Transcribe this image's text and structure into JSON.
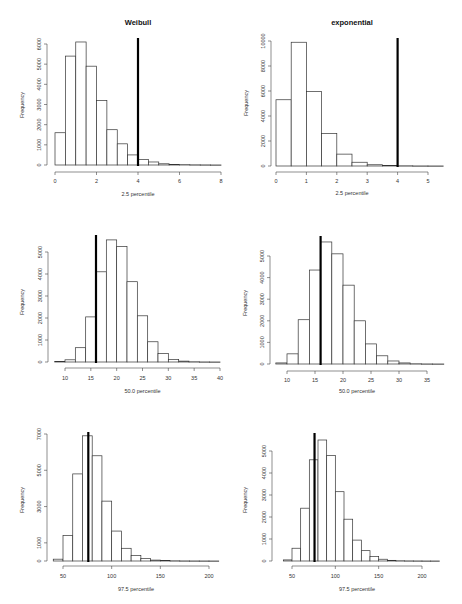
{
  "page": {
    "column_titles": [
      "Weibull",
      "exponential"
    ]
  },
  "chart_data": [
    {
      "id": "weibull-2.5",
      "type": "bar",
      "title": "Weibull",
      "xlabel": "2.5 percentile",
      "ylabel": "Frequency",
      "x_start": 0,
      "bin_width": 0.5,
      "values": [
        1600,
        5400,
        6100,
        4900,
        3200,
        1750,
        1050,
        500,
        280,
        150,
        60,
        30,
        15,
        8,
        5,
        2
      ],
      "xticks": [
        0,
        2,
        4,
        6,
        8
      ],
      "yticks": [
        0,
        1000,
        2000,
        3000,
        4000,
        5000,
        6000
      ],
      "xlim": [
        0,
        8
      ],
      "ylim": [
        0,
        6000
      ],
      "vline": 4,
      "grid": false
    },
    {
      "id": "exponential-2.5",
      "type": "bar",
      "title": "exponential",
      "xlabel": "2.5 percentile",
      "ylabel": "Frequency",
      "x_start": 0,
      "bin_width": 0.5,
      "values": [
        5300,
        9900,
        5950,
        2600,
        950,
        300,
        100,
        40,
        15,
        5,
        3
      ],
      "xticks": [
        0,
        1,
        2,
        3,
        4,
        5
      ],
      "yticks": [
        0,
        2000,
        4000,
        6000,
        8000,
        10000
      ],
      "xlim": [
        0,
        5
      ],
      "ylim": [
        0,
        10000
      ],
      "vline": 4,
      "grid": false
    },
    {
      "id": "weibull-50.0",
      "type": "bar",
      "title": "",
      "xlabel": "50.0 percentile",
      "ylabel": "Frequency",
      "x_start": 8,
      "bin_width": 2,
      "values": [
        20,
        100,
        650,
        2050,
        4100,
        5550,
        5250,
        3650,
        2100,
        920,
        380,
        120,
        40,
        10,
        3,
        1
      ],
      "xticks": [
        10,
        15,
        20,
        25,
        30,
        35,
        40
      ],
      "yticks": [
        0,
        1000,
        2000,
        3000,
        4000,
        5000
      ],
      "xlim": [
        10,
        40
      ],
      "ylim": [
        0,
        5000
      ],
      "vline": 16,
      "grid": false
    },
    {
      "id": "exponential-50.0",
      "type": "bar",
      "title": "",
      "xlabel": "50.0 percentile",
      "ylabel": "Frequency",
      "x_start": 8,
      "bin_width": 2,
      "values": [
        50,
        470,
        2050,
        4350,
        5650,
        5100,
        3650,
        2000,
        930,
        380,
        140,
        50,
        10,
        3,
        1
      ],
      "xticks": [
        10,
        15,
        20,
        25,
        30,
        35
      ],
      "yticks": [
        0,
        1000,
        2000,
        3000,
        4000,
        5000
      ],
      "xlim": [
        10,
        35
      ],
      "ylim": [
        0,
        5000
      ],
      "vline": 16,
      "grid": false
    },
    {
      "id": "weibull-97.5",
      "type": "bar",
      "title": "",
      "xlabel": "97.5 percentile",
      "ylabel": "Frequency",
      "x_start": 40,
      "bin_width": 10,
      "values": [
        100,
        1400,
        4800,
        6900,
        5800,
        3300,
        1650,
        700,
        300,
        130,
        50,
        20,
        10,
        5,
        3,
        2,
        1
      ],
      "xticks": [
        50,
        100,
        150,
        200
      ],
      "yticks": [
        0,
        1000,
        3000,
        5000,
        7000
      ],
      "xlim": [
        50,
        200
      ],
      "ylim": [
        0,
        7000
      ],
      "vline": 76,
      "grid": false
    },
    {
      "id": "exponential-97.5",
      "type": "bar",
      "title": "",
      "xlabel": "97.5 percentile",
      "ylabel": "Frequency",
      "x_start": 40,
      "bin_width": 10,
      "values": [
        50,
        580,
        2400,
        4600,
        5500,
        4800,
        3150,
        1900,
        950,
        470,
        200,
        80,
        30,
        10,
        5,
        3,
        1,
        1
      ],
      "xticks": [
        50,
        100,
        150,
        200
      ],
      "yticks": [
        0,
        1000,
        2000,
        3000,
        4000,
        5000
      ],
      "xlim": [
        50,
        200
      ],
      "ylim": [
        0,
        5000
      ],
      "vline": 76,
      "grid": false
    }
  ],
  "layout": [
    {
      "x0px": 55,
      "x1px": 221,
      "xv0": 0,
      "xv1": 8,
      "basey": 165,
      "topy": 44,
      "yv_top": 6000,
      "axis_y": 172,
      "yaxis_x": 47,
      "ytick_top": 44,
      "title_y": 25,
      "xlabel_y": 196,
      "ylab_x": 24,
      "ylab_y": 105,
      "vline_top": 38,
      "tick_label_y": 181,
      "ytick_vals_y0": 165
    },
    {
      "x0px": 276,
      "x1px": 428,
      "xv0": 0,
      "xv1": 5,
      "basey": 166,
      "topy": 41,
      "yv_top": 10000,
      "axis_y": 172,
      "yaxis_x": 271,
      "ytick_top": 41,
      "title_y": 25,
      "xlabel_y": 195,
      "ylab_x": 248,
      "ylab_y": 103,
      "vline_top": 38,
      "tick_label_y": 181
    },
    {
      "x0px": 65,
      "x1px": 220,
      "xv0": 10,
      "xv1": 40,
      "basey": 362,
      "topy": 252,
      "yv_top": 5000,
      "axis_y": 368,
      "yaxis_x": 48,
      "ytick_top": 252,
      "title_y": 0,
      "xlabel_y": 393,
      "ylab_x": 24,
      "ylab_y": 302,
      "vline_top": 235,
      "tick_label_y": 378
    },
    {
      "x0px": 287,
      "x1px": 427,
      "xv0": 10,
      "xv1": 35,
      "basey": 364,
      "topy": 256,
      "yv_top": 5000,
      "axis_y": 371,
      "yaxis_x": 270,
      "ytick_top": 256,
      "title_y": 0,
      "xlabel_y": 393,
      "ylab_x": 247,
      "ylab_y": 303,
      "vline_top": 236,
      "tick_label_y": 380
    },
    {
      "x0px": 63,
      "x1px": 209,
      "xv0": 50,
      "xv1": 200,
      "basey": 561,
      "topy": 434,
      "yv_top": 7000,
      "axis_y": 566,
      "yaxis_x": 47,
      "ytick_top": 434,
      "title_y": 0,
      "xlabel_y": 591,
      "ylab_x": 24,
      "ylab_y": 500,
      "vline_top": 432,
      "tick_label_y": 576
    },
    {
      "x0px": 292,
      "x1px": 422,
      "xv0": 50,
      "xv1": 200,
      "basey": 561,
      "topy": 451,
      "yv_top": 5000,
      "axis_y": 566,
      "yaxis_x": 272,
      "ytick_top": 451,
      "title_y": 0,
      "xlabel_y": 591,
      "ylab_x": 247,
      "ylab_y": 500,
      "vline_top": 433,
      "tick_label_y": 576
    }
  ]
}
